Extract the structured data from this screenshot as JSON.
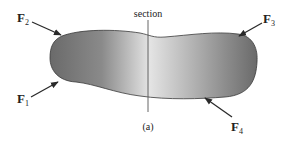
{
  "figure": {
    "section_label": "section",
    "caption": "(a)",
    "forces": [
      {
        "id": "F1",
        "symbol": "F",
        "subscript": "1"
      },
      {
        "id": "F2",
        "symbol": "F",
        "subscript": "2"
      },
      {
        "id": "F3",
        "symbol": "F",
        "subscript": "3"
      },
      {
        "id": "F4",
        "symbol": "F",
        "subscript": "4"
      }
    ],
    "colors": {
      "body_dark": "#6e6e6e",
      "body_light": "#e2e2e2",
      "outline": "#3a3a3a",
      "arrow": "#2a2a2a",
      "section_line": "#555555"
    }
  }
}
